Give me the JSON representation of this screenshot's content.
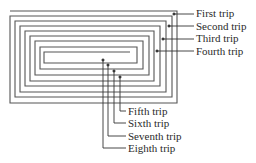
{
  "diagram": {
    "type": "spiral-path",
    "stroke_color": "#555555",
    "text_color": "#2a2a2a",
    "labels_right": [
      {
        "text": "First trip",
        "x": 196,
        "y": 7
      },
      {
        "text": "Second trip",
        "x": 196,
        "y": 20
      },
      {
        "text": "Third trip",
        "x": 196,
        "y": 32
      },
      {
        "text": "Fourth trip",
        "x": 196,
        "y": 45
      }
    ],
    "labels_bottom": [
      {
        "text": "Fifth trip",
        "x": 128,
        "y": 105
      },
      {
        "text": "Sixth trip",
        "x": 128,
        "y": 117
      },
      {
        "text": "Seventh trip",
        "x": 128,
        "y": 130
      },
      {
        "text": "Eighth trip",
        "x": 128,
        "y": 142
      }
    ]
  }
}
